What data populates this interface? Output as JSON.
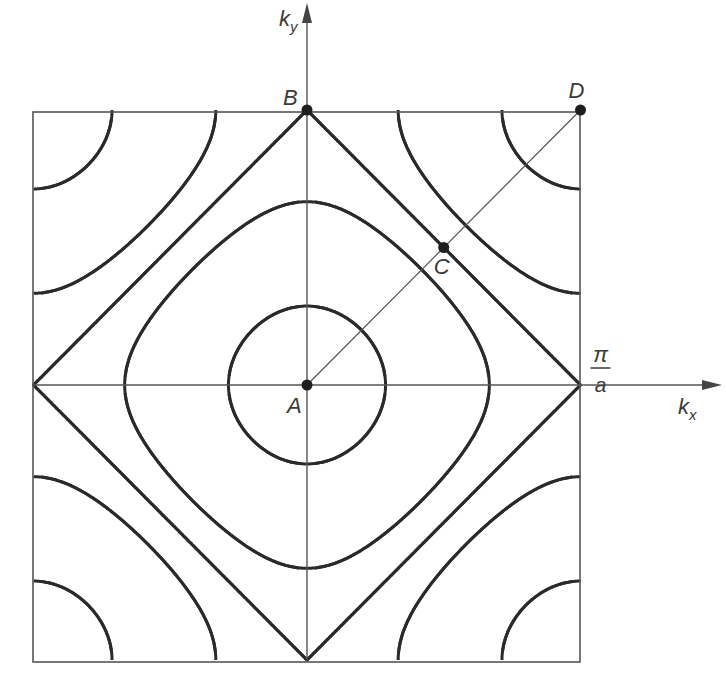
{
  "diagram": {
    "colors": {
      "ink": "#2a2a2a",
      "thin": "#555555",
      "background": "#ffffff"
    },
    "zone": {
      "left": 33,
      "right": 580,
      "top": 112,
      "bottom": 662
    },
    "origin": {
      "x": 307,
      "y": 385
    },
    "axes": {
      "kx": {
        "label_main": "k",
        "label_sub": "x",
        "arrow_end_x": 722
      },
      "ky": {
        "label_main": "k",
        "label_sub": "y",
        "arrow_end_y": 3
      }
    },
    "boundary_label": {
      "numerator": "π",
      "denominator": "a"
    },
    "energy_levels": [
      1.62,
      0.5,
      0.0,
      -0.5,
      -1.62
    ],
    "points": [
      {
        "id": "A",
        "label": "A",
        "kx": 0,
        "ky": 0,
        "label_dx": -20,
        "label_dy": 28
      },
      {
        "id": "B",
        "label": "B",
        "kx": 0,
        "ky": 1,
        "label_dx": -24,
        "label_dy": -5
      },
      {
        "id": "C",
        "label": "C",
        "kx": 0.5,
        "ky": 0.5,
        "label_dx": -10,
        "label_dy": 26
      },
      {
        "id": "D",
        "label": "D",
        "kx": 1,
        "ky": 1,
        "label_dx": -12,
        "label_dy": -12
      }
    ],
    "diagonal": {
      "from": "A",
      "to": "D"
    }
  }
}
